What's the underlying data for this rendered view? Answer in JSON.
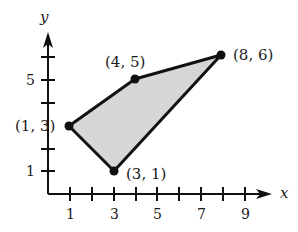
{
  "diagram": {
    "type": "coordinate-plane-polygon",
    "axes": {
      "x_label": "x",
      "y_label": "y",
      "x_tick_labels": [
        "1",
        "3",
        "5",
        "7",
        "9"
      ],
      "y_tick_labels": [
        "1",
        "5"
      ]
    },
    "polygon": {
      "fill": "#d3d3d3",
      "stroke": "#111111",
      "vertices": [
        {
          "x": 1,
          "y": 3,
          "label": "(1, 3)"
        },
        {
          "x": 4,
          "y": 5,
          "label": "(4, 5)"
        },
        {
          "x": 8,
          "y": 6,
          "label": "(8, 6)"
        },
        {
          "x": 3,
          "y": 1,
          "label": "(3, 1)"
        }
      ]
    }
  }
}
